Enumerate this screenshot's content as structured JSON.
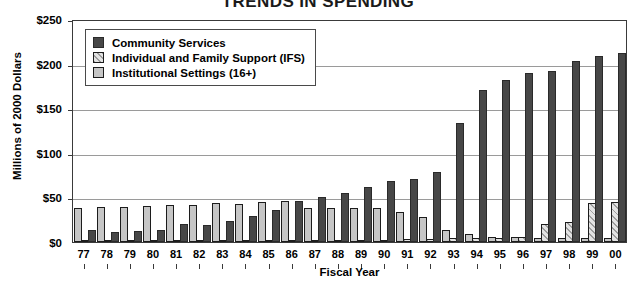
{
  "chart_data": {
    "type": "bar",
    "title": "TRENDS IN SPENDING",
    "xlabel": "Fiscal Year",
    "ylabel": "Millions of 2000 Dollars",
    "ylim": [
      0,
      250
    ],
    "yticks": [
      "$0",
      "$50",
      "$100",
      "$150",
      "$200",
      "$250"
    ],
    "ytick_values": [
      0,
      50,
      100,
      150,
      200,
      250
    ],
    "grid": true,
    "legend_position": "upper-left-inside",
    "categories": [
      "77",
      "78",
      "79",
      "80",
      "81",
      "82",
      "83",
      "84",
      "85",
      "86",
      "87",
      "88",
      "89",
      "90",
      "91",
      "92",
      "93",
      "94",
      "95",
      "96",
      "97",
      "98",
      "99",
      "00"
    ],
    "series": [
      {
        "name": "Community Services",
        "color": "#474747",
        "values": [
          13,
          11,
          12,
          14,
          20,
          19,
          24,
          29,
          36,
          46,
          51,
          55,
          62,
          68,
          71,
          79,
          133,
          170,
          182,
          189,
          192,
          203,
          208,
          212
        ]
      },
      {
        "name": "Individual and Family Support (IFS)",
        "color": "#e3e3e3",
        "values": [
          1,
          1,
          1,
          1,
          2,
          2,
          2,
          2,
          2,
          2,
          2,
          2,
          2,
          2,
          3,
          3,
          4,
          4,
          5,
          6,
          20,
          22,
          44,
          45
        ]
      },
      {
        "name": "Institutional Settings (16+)",
        "color": "#c6c6c6",
        "values": [
          38,
          39,
          39,
          40,
          42,
          41,
          44,
          43,
          45,
          46,
          38,
          38,
          38,
          38,
          34,
          28,
          13,
          9,
          6,
          6,
          5,
          5,
          5,
          5
        ]
      }
    ]
  },
  "legend": {
    "items": [
      {
        "label": "Community Services",
        "swatch": "solid-dark"
      },
      {
        "label": "Individual and Family Support (IFS)",
        "swatch": "hatched-light"
      },
      {
        "label": "Institutional Settings (16+)",
        "swatch": "solid-light-gray"
      }
    ]
  }
}
